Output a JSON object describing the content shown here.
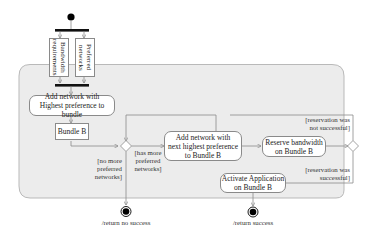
{
  "diagram": {
    "type": "UML activity diagram",
    "colors": {
      "region_fill": "#ececec",
      "region_border": "#b9b9b9",
      "node_border": "#8a8a8a",
      "edge": "#8a8a8a",
      "initial_final": "#000000"
    },
    "fork_objects": [
      {
        "label": "Bandwidth requirements"
      },
      {
        "label": "Preferred networks"
      }
    ],
    "actions": {
      "add_highest": "Add network with Highest preference to bundle",
      "add_highest_line1": "Add network with",
      "add_highest_line2": "Highest preference to bundle",
      "bundle_b": "Bundle B",
      "add_next_line1": "Add network with",
      "add_next_line2": "next highest preference",
      "add_next_line3": "to Bundle B",
      "reserve_line1": "Reserve bandwidth",
      "reserve_line2": "on Bundle B",
      "activate_line1": "Activate Application",
      "activate_line2": "on Bundle B"
    },
    "guards": {
      "no_more_line1": "[no more",
      "no_more_line2": "preferred",
      "no_more_line3": "networks]",
      "has_more_line1": "[has more",
      "has_more_line2": "preferred",
      "has_more_line3": "networks]",
      "not_successful_line1": "[reservation was",
      "not_successful_line2": "not successful]",
      "successful_line1": "[reservation was",
      "successful_line2": "successful]"
    },
    "finals": {
      "no_success": "/return no success",
      "success": "/return success"
    }
  }
}
